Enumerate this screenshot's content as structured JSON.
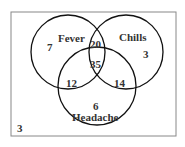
{
  "diagram": {
    "type": "venn",
    "sets": [
      {
        "name": "Fever"
      },
      {
        "name": "Chills"
      },
      {
        "name": "Headache"
      }
    ],
    "regions": {
      "fever_only": "7",
      "chills_only": "3",
      "headache_only": "6",
      "fever_chills": "20",
      "fever_headache": "12",
      "chills_headache": "14",
      "all_three": "35",
      "outside": "3"
    },
    "colors": {
      "border": "#888888",
      "circle": "#111111",
      "text": "#333333"
    }
  }
}
